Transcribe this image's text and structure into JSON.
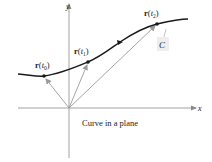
{
  "figure": {
    "caption": "Curve in a plane",
    "axes": {
      "x_label": "x",
      "y_label": "y"
    },
    "curve_label": "C",
    "points": [
      {
        "name": "r(t0)",
        "bold": "r",
        "open": "(",
        "var": "t",
        "sub": "0",
        "close": ")"
      },
      {
        "name": "r(t1)",
        "bold": "r",
        "open": "(",
        "var": "t",
        "sub": "1",
        "close": ")"
      },
      {
        "name": "r(t2)",
        "bold": "r",
        "open": "(",
        "var": "t",
        "sub": "2",
        "close": ")"
      }
    ],
    "colors": {
      "curve": "#1a1a1a",
      "axes": "#8a8a8a",
      "vectors": "#9a9a9a",
      "label_box": "#eeeeee"
    }
  }
}
